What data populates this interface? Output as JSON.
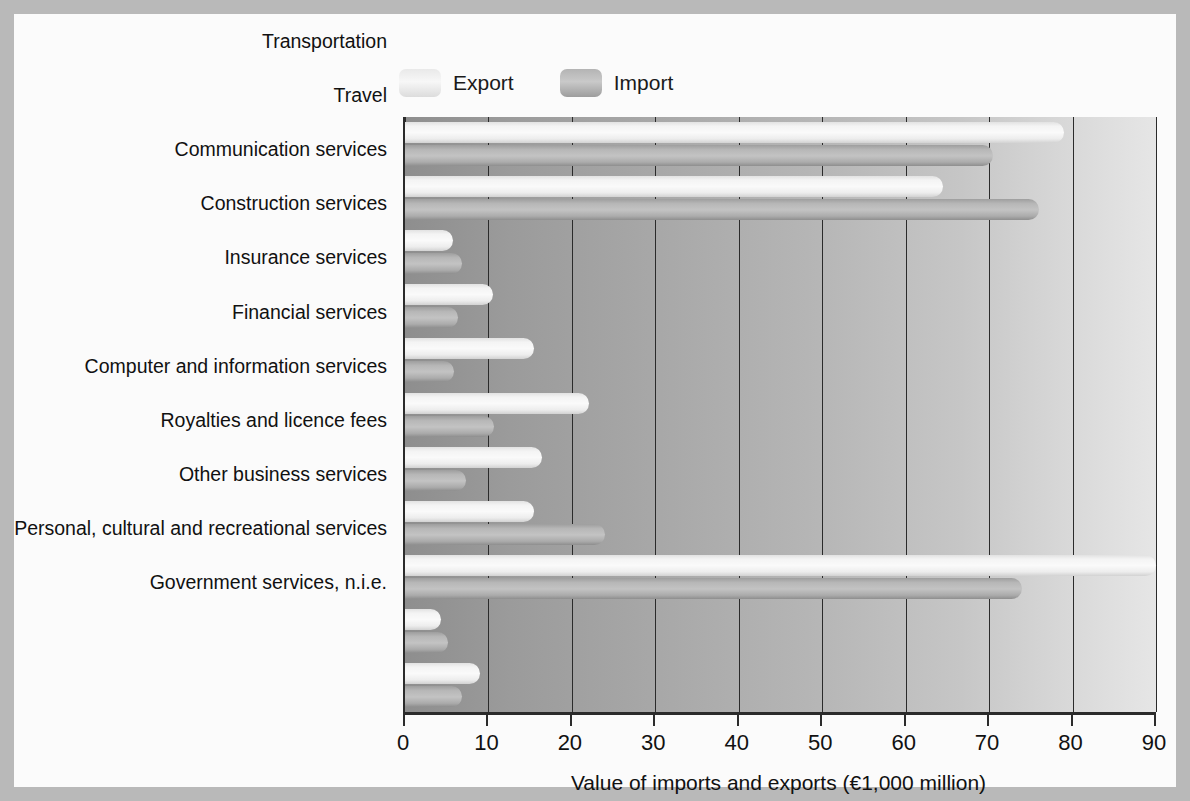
{
  "legend": {
    "items": [
      {
        "label": "Export",
        "key": "export",
        "color": "#f2f2f2"
      },
      {
        "label": "Import",
        "key": "import",
        "color": "#b5b5b5"
      }
    ]
  },
  "chart_data": {
    "type": "bar",
    "orientation": "horizontal",
    "title": "",
    "xlabel": "Value of imports and exports (€1,000 million)",
    "ylabel": "",
    "xlim": [
      0,
      90
    ],
    "xticks": [
      0,
      10,
      20,
      30,
      40,
      50,
      60,
      70,
      80,
      90
    ],
    "grid": true,
    "legend_position": "top-left",
    "categories": [
      "Transportation",
      "Travel",
      "Communication services",
      "Construction services",
      "Insurance services",
      "Financial services",
      "Computer and information services",
      "Royalties and licence fees",
      "Other business services",
      "Personal, cultural and recreational services",
      "Government services, n.i.e."
    ],
    "series": [
      {
        "name": "Export",
        "values": [
          79.0,
          64.5,
          5.8,
          10.6,
          15.5,
          22.0,
          16.4,
          15.5,
          90.0,
          4.3,
          9.0
        ]
      },
      {
        "name": "Import",
        "values": [
          70.5,
          76.0,
          6.8,
          6.4,
          5.9,
          10.7,
          7.3,
          24.0,
          74.0,
          5.2,
          6.8
        ]
      }
    ]
  }
}
